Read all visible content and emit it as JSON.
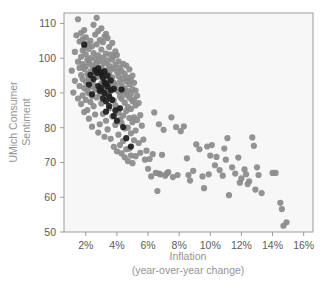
{
  "chart_data": {
    "type": "scatter",
    "title": "",
    "xlabel": "Inflation",
    "xlabel_sub": "(year-over-year change)",
    "ylabel_line1": "UMich Consumer",
    "ylabel_line2": "Sentiment",
    "xlim": [
      0.6,
      16.6
    ],
    "ylim": [
      50,
      113
    ],
    "xticks": [
      2,
      4,
      6,
      8,
      10,
      12,
      14,
      16
    ],
    "xtick_labels": [
      "2%",
      "4%",
      "6%",
      "8%",
      "10%",
      "12%",
      "14%",
      "16%"
    ],
    "yticks": [
      50,
      60,
      70,
      80,
      90,
      100,
      110
    ],
    "ytick_labels": [
      "50",
      "60",
      "70",
      "80",
      "90",
      "100",
      "110"
    ],
    "grid": false,
    "legend": "none",
    "marker_size_px": 3.1,
    "colors": {
      "primary_marker": "#8a8a8a",
      "highlight_marker": "#1c1c1c",
      "axis": "#9b9b9b",
      "tick_label": "#5c5c5c",
      "axis_title": "#949494",
      "plot_background": "#f7f7f7",
      "figure_background": "#ffffff"
    },
    "series": [
      {
        "name": "All months",
        "color": "#8a8a8a",
        "points": [
          [
            1.1,
            96.4
          ],
          [
            1.2,
            90.1
          ],
          [
            1.3,
            93.5
          ],
          [
            1.3,
            101.8
          ],
          [
            1.4,
            106.6
          ],
          [
            1.5,
            111.2
          ],
          [
            1.5,
            99.0
          ],
          [
            1.5,
            88.4
          ],
          [
            1.6,
            104.8
          ],
          [
            1.6,
            97.2
          ],
          [
            1.6,
            92.0
          ],
          [
            1.7,
            107.3
          ],
          [
            1.7,
            100.4
          ],
          [
            1.7,
            95.1
          ],
          [
            1.7,
            86.8
          ],
          [
            1.8,
            105.5
          ],
          [
            1.8,
            102.2
          ],
          [
            1.8,
            98.3
          ],
          [
            1.8,
            94.0
          ],
          [
            1.8,
            89.3
          ],
          [
            1.9,
            108.1
          ],
          [
            1.9,
            103.0
          ],
          [
            1.9,
            96.9
          ],
          [
            1.9,
            91.4
          ],
          [
            1.9,
            84.5
          ],
          [
            2.0,
            106.0
          ],
          [
            2.0,
            101.1
          ],
          [
            2.0,
            97.6
          ],
          [
            2.0,
            93.2
          ],
          [
            2.0,
            88.0
          ],
          [
            2.1,
            104.2
          ],
          [
            2.1,
            99.5
          ],
          [
            2.1,
            95.4
          ],
          [
            2.1,
            90.6
          ],
          [
            2.1,
            85.1
          ],
          [
            2.2,
            102.7
          ],
          [
            2.2,
            98.8
          ],
          [
            2.2,
            94.3
          ],
          [
            2.2,
            89.9
          ],
          [
            2.2,
            82.6
          ],
          [
            2.3,
            105.0
          ],
          [
            2.3,
            100.0
          ],
          [
            2.3,
            96.2
          ],
          [
            2.3,
            91.8
          ],
          [
            2.3,
            87.4
          ],
          [
            2.4,
            103.4
          ],
          [
            2.4,
            98.0
          ],
          [
            2.4,
            93.7
          ],
          [
            2.4,
            89.1
          ],
          [
            2.4,
            80.3
          ],
          [
            2.5,
            109.6
          ],
          [
            2.5,
            101.5
          ],
          [
            2.5,
            97.0
          ],
          [
            2.5,
            92.4
          ],
          [
            2.5,
            86.2
          ],
          [
            2.6,
            106.8
          ],
          [
            2.6,
            99.8
          ],
          [
            2.6,
            95.7
          ],
          [
            2.6,
            90.9
          ],
          [
            2.6,
            83.8
          ],
          [
            2.7,
            111.6
          ],
          [
            2.7,
            104.0
          ],
          [
            2.7,
            98.5
          ],
          [
            2.7,
            94.6
          ],
          [
            2.7,
            88.7
          ],
          [
            2.8,
            107.8
          ],
          [
            2.8,
            100.8
          ],
          [
            2.8,
            96.0
          ],
          [
            2.8,
            91.2
          ],
          [
            2.8,
            78.6
          ],
          [
            2.9,
            105.2
          ],
          [
            2.9,
            99.2
          ],
          [
            2.9,
            94.8
          ],
          [
            2.9,
            89.6
          ],
          [
            2.9,
            81.0
          ],
          [
            3.0,
            108.6
          ],
          [
            3.0,
            102.5
          ],
          [
            3.0,
            97.4
          ],
          [
            3.0,
            92.8
          ],
          [
            3.0,
            87.0
          ],
          [
            3.1,
            104.6
          ],
          [
            3.1,
            100.2
          ],
          [
            3.1,
            95.9
          ],
          [
            3.1,
            90.3
          ],
          [
            3.1,
            84.0
          ],
          [
            3.2,
            106.2
          ],
          [
            3.2,
            98.6
          ],
          [
            3.2,
            94.1
          ],
          [
            3.2,
            88.9
          ],
          [
            3.2,
            77.4
          ],
          [
            3.3,
            107.0
          ],
          [
            3.3,
            101.3
          ],
          [
            3.3,
            96.5
          ],
          [
            3.3,
            91.6
          ],
          [
            3.3,
            82.0
          ],
          [
            3.4,
            105.8
          ],
          [
            3.4,
            99.4
          ],
          [
            3.4,
            93.9
          ],
          [
            3.4,
            89.4
          ],
          [
            3.4,
            79.5
          ],
          [
            3.5,
            103.2
          ],
          [
            3.5,
            97.8
          ],
          [
            3.5,
            95.2
          ],
          [
            3.5,
            90.0
          ],
          [
            3.5,
            85.6
          ],
          [
            3.6,
            101.0
          ],
          [
            3.6,
            96.6
          ],
          [
            3.6,
            92.6
          ],
          [
            3.6,
            88.2
          ],
          [
            3.6,
            76.8
          ],
          [
            3.7,
            104.4
          ],
          [
            3.7,
            99.6
          ],
          [
            3.7,
            94.5
          ],
          [
            3.7,
            90.8
          ],
          [
            3.7,
            83.2
          ],
          [
            3.8,
            100.6
          ],
          [
            3.8,
            97.1
          ],
          [
            3.8,
            93.0
          ],
          [
            3.8,
            87.8
          ],
          [
            3.8,
            74.5
          ],
          [
            3.9,
            102.0
          ],
          [
            3.9,
            98.1
          ],
          [
            3.9,
            92.2
          ],
          [
            3.9,
            86.5
          ],
          [
            3.9,
            80.8
          ],
          [
            4.0,
            100.9
          ],
          [
            4.0,
            96.1
          ],
          [
            4.0,
            91.0
          ],
          [
            4.0,
            85.8
          ],
          [
            4.0,
            73.2
          ],
          [
            4.1,
            99.1
          ],
          [
            4.1,
            94.9
          ],
          [
            4.1,
            90.4
          ],
          [
            4.1,
            84.3
          ],
          [
            4.1,
            78.0
          ],
          [
            4.2,
            97.3
          ],
          [
            4.2,
            93.3
          ],
          [
            4.2,
            89.0
          ],
          [
            4.2,
            82.4
          ],
          [
            4.2,
            75.0
          ],
          [
            4.3,
            96.3
          ],
          [
            4.3,
            92.1
          ],
          [
            4.3,
            88.3
          ],
          [
            4.3,
            81.4
          ],
          [
            4.3,
            72.6
          ],
          [
            4.4,
            98.4
          ],
          [
            4.4,
            94.2
          ],
          [
            4.4,
            90.2
          ],
          [
            4.4,
            83.5
          ],
          [
            4.4,
            76.2
          ],
          [
            4.5,
            95.5
          ],
          [
            4.5,
            91.3
          ],
          [
            4.5,
            87.2
          ],
          [
            4.5,
            79.8
          ],
          [
            4.5,
            71.5
          ],
          [
            4.6,
            97.9
          ],
          [
            4.6,
            93.4
          ],
          [
            4.6,
            89.5
          ],
          [
            4.6,
            84.8
          ],
          [
            4.6,
            73.8
          ],
          [
            4.7,
            94.4
          ],
          [
            4.7,
            90.5
          ],
          [
            4.7,
            86.0
          ],
          [
            4.7,
            80.0
          ],
          [
            4.7,
            70.4
          ],
          [
            4.8,
            96.8
          ],
          [
            4.8,
            92.5
          ],
          [
            4.8,
            88.6
          ],
          [
            4.8,
            82.8
          ],
          [
            4.8,
            74.0
          ],
          [
            4.9,
            93.6
          ],
          [
            4.9,
            89.8
          ],
          [
            4.9,
            85.4
          ],
          [
            4.9,
            78.4
          ],
          [
            4.9,
            72.0
          ],
          [
            5.0,
            95.0
          ],
          [
            5.0,
            91.1
          ],
          [
            5.0,
            87.6
          ],
          [
            5.0,
            81.6
          ],
          [
            5.0,
            69.8
          ],
          [
            5.1,
            92.9
          ],
          [
            5.1,
            88.1
          ],
          [
            5.1,
            83.0
          ],
          [
            5.1,
            76.4
          ],
          [
            5.2,
            90.7
          ],
          [
            5.2,
            86.4
          ],
          [
            5.2,
            79.2
          ],
          [
            5.2,
            71.8
          ],
          [
            5.3,
            89.2
          ],
          [
            5.3,
            82.2
          ],
          [
            5.4,
            87.1
          ],
          [
            5.4,
            75.6
          ],
          [
            5.5,
            83.6
          ],
          [
            5.5,
            72.8
          ],
          [
            5.6,
            80.6
          ],
          [
            5.7,
            76.6
          ],
          [
            5.8,
            70.8
          ],
          [
            5.9,
            73.4
          ],
          [
            6.0,
            68.2
          ],
          [
            6.1,
            71.0
          ],
          [
            6.2,
            66.0
          ],
          [
            6.3,
            72.4
          ],
          [
            6.4,
            84.4
          ],
          [
            6.5,
            67.0
          ],
          [
            6.6,
            61.8
          ],
          [
            6.7,
            81.0
          ],
          [
            6.8,
            66.6
          ],
          [
            6.9,
            72.2
          ],
          [
            7.0,
            79.4
          ],
          [
            7.1,
            66.2
          ],
          [
            7.3,
            67.2
          ],
          [
            7.5,
            83.0
          ],
          [
            7.6,
            65.8
          ],
          [
            7.8,
            80.2
          ],
          [
            7.9,
            66.4
          ],
          [
            8.1,
            79.0
          ],
          [
            8.3,
            80.4
          ],
          [
            8.5,
            71.2
          ],
          [
            8.7,
            64.8
          ],
          [
            8.9,
            67.6
          ],
          [
            9.1,
            75.2
          ],
          [
            9.3,
            73.8
          ],
          [
            9.5,
            66.0
          ],
          [
            9.6,
            62.6
          ],
          [
            9.8,
            74.6
          ],
          [
            10.0,
            72.0
          ],
          [
            10.1,
            75.0
          ],
          [
            10.3,
            69.2
          ],
          [
            10.4,
            71.6
          ],
          [
            10.6,
            67.8
          ],
          [
            10.8,
            66.2
          ],
          [
            10.9,
            74.0
          ],
          [
            11.0,
            70.8
          ],
          [
            11.1,
            77.0
          ],
          [
            11.2,
            60.6
          ],
          [
            11.4,
            68.6
          ],
          [
            11.6,
            66.8
          ],
          [
            11.8,
            71.4
          ],
          [
            12.0,
            65.4
          ],
          [
            12.2,
            68.0
          ],
          [
            12.4,
            63.8
          ],
          [
            12.5,
            64.6
          ],
          [
            12.7,
            77.2
          ],
          [
            12.8,
            74.8
          ],
          [
            12.9,
            62.2
          ],
          [
            13.1,
            66.4
          ],
          [
            13.3,
            61.2
          ],
          [
            14.0,
            67.0
          ],
          [
            14.2,
            67.0
          ],
          [
            14.5,
            58.4
          ],
          [
            14.6,
            56.6
          ],
          [
            14.7,
            51.8
          ],
          [
            14.9,
            52.8
          ],
          [
            13.0,
            68.6
          ],
          [
            12.3,
            66.6
          ],
          [
            11.9,
            64.2
          ],
          [
            9.9,
            66.6
          ],
          [
            8.6,
            66.4
          ],
          [
            7.2,
            66.8
          ],
          [
            6.7,
            66.8
          ]
        ]
      },
      {
        "name": "Highlighted months",
        "color": "#1c1c1c",
        "points": [
          [
            1.9,
            103.9
          ],
          [
            2.3,
            95.2
          ],
          [
            2.5,
            94.0
          ],
          [
            2.6,
            96.6
          ],
          [
            2.7,
            95.8
          ],
          [
            2.8,
            97.1
          ],
          [
            2.8,
            92.0
          ],
          [
            2.9,
            96.0
          ],
          [
            2.9,
            90.6
          ],
          [
            3.0,
            95.4
          ],
          [
            3.0,
            91.4
          ],
          [
            3.1,
            94.4
          ],
          [
            3.1,
            88.4
          ],
          [
            3.2,
            96.2
          ],
          [
            3.2,
            93.0
          ],
          [
            3.2,
            90.0
          ],
          [
            3.3,
            92.6
          ],
          [
            3.3,
            87.6
          ],
          [
            3.4,
            95.0
          ],
          [
            3.4,
            91.8
          ],
          [
            3.5,
            89.0
          ],
          [
            3.5,
            86.2
          ],
          [
            3.6,
            93.6
          ],
          [
            3.6,
            90.8
          ],
          [
            3.7,
            88.0
          ],
          [
            3.8,
            91.2
          ],
          [
            3.9,
            85.0
          ],
          [
            4.0,
            82.0
          ],
          [
            4.2,
            85.6
          ],
          [
            4.3,
            91.0
          ],
          [
            4.4,
            80.2
          ],
          [
            4.6,
            77.0
          ],
          [
            4.9,
            74.6
          ],
          [
            2.2,
            92.4
          ],
          [
            2.4,
            89.6
          ],
          [
            3.3,
            84.6
          ],
          [
            3.8,
            83.4
          ]
        ]
      }
    ]
  }
}
